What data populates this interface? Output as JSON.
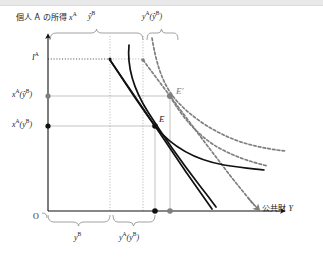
{
  "figure": {
    "domain_type": "economics-diagram",
    "axes": {
      "y_axis_label_jp": "個人 A の所得",
      "y_axis_label_math": "x",
      "y_axis_label_math_sup": "A",
      "y_axis_extra_label": "ŷ",
      "y_axis_extra_label_sup": "B",
      "x_axis_label_jp": "公共財",
      "x_axis_label_math": "Y",
      "origin_label": "O"
    },
    "y_ticks": [
      {
        "name": "income-level",
        "label_base": "I",
        "label_sup": "A",
        "value_px": 59,
        "marker": "none"
      },
      {
        "name": "consumption-at-yhatB",
        "label_base": "x",
        "label_sup": "A",
        "label_arg": "(ŷ",
        "label_arg_sup": "B",
        "label_close": ")",
        "value_px": 96,
        "marker": "gray-dot"
      },
      {
        "name": "consumption-at-yB",
        "label_base": "x",
        "label_sup": "A",
        "label_arg": "(y",
        "label_arg_sup": "B",
        "label_close": ")",
        "value_px": 126,
        "marker": "black-dot"
      }
    ],
    "x_braces": [
      {
        "name": "brace-yB",
        "label_base": "y",
        "label_sup": "B",
        "from_px": 48,
        "to_px": 110
      },
      {
        "name": "brace-yA-of-yB",
        "label_base": "y",
        "label_sup": "A",
        "label_arg": "(y",
        "label_arg_sup": "B",
        "label_close": ")",
        "from_px": 113,
        "to_px": 155
      }
    ],
    "top_braces": [
      {
        "name": "brace-top-yhatB",
        "from_px": 50,
        "to_px": 143
      },
      {
        "name": "brace-top-yA-of-yhatB",
        "from_px": 146,
        "to_px": 178
      }
    ],
    "equilibria": [
      {
        "name": "equilibrium-E",
        "label": "E",
        "x_px": 155,
        "y_px": 126,
        "color": "#111111"
      },
      {
        "name": "equilibrium-E-prime",
        "label": "E′",
        "x_px": 170,
        "y_px": 96,
        "color": "#7f7f7f"
      }
    ],
    "x_axis_dots": [
      {
        "name": "x-dot-yB-total",
        "x_px": 155,
        "color": "#111111"
      },
      {
        "name": "x-dot-yhatB-total",
        "x_px": 170,
        "color": "#7f7f7f"
      }
    ],
    "curves": [
      {
        "name": "budget-line-solid",
        "style": "solid",
        "color": "#111111"
      },
      {
        "name": "budget-line-shifted-solid",
        "style": "solid",
        "color": "#111111"
      },
      {
        "name": "indifference-curve-solid",
        "style": "solid",
        "color": "#111111"
      },
      {
        "name": "budget-line-dashed",
        "style": "dashed",
        "color": "#7f7f7f"
      },
      {
        "name": "indifference-curve-dashed-upper",
        "style": "dashed",
        "color": "#7f7f7f"
      },
      {
        "name": "indifference-curve-dashed-lower",
        "style": "dashed",
        "color": "#7f7f7f"
      }
    ],
    "colors": {
      "axis": "#111111",
      "solid_curve": "#111111",
      "dashed_curve": "#7f7f7f",
      "guide_line": "#9a9a9a",
      "dotted_guide": "#9a9a9a",
      "brace": "#8a8a8a",
      "background": "#ffffff",
      "top_band": "#e9e9e9"
    }
  }
}
